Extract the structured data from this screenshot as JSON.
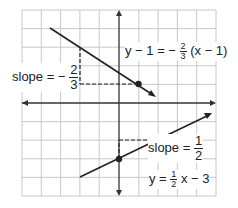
{
  "graph": {
    "grid": {
      "x_min": -5,
      "x_max": 5,
      "y_min": -5,
      "y_max": 5,
      "step": 1
    },
    "colors": {
      "grid": "#c8c8c8",
      "axis": "#333333",
      "line": "#222222",
      "dash": "#222222"
    },
    "lines": [
      {
        "equation_label": {
          "lhs": "y − 1 = −",
          "frac_num": "2",
          "frac_den": "3",
          "rhs": "(x − 1)"
        },
        "slope_label": {
          "prefix": "slope = −",
          "frac_num": "2",
          "frac_den": "3"
        },
        "point": [
          1,
          1
        ],
        "from": [
          -3.5,
          4
        ],
        "to": [
          2,
          0.33
        ],
        "slope": -0.6667
      },
      {
        "equation_label": {
          "lhs": "y =",
          "frac_num": "1",
          "frac_den": "2",
          "rhs": "x − 3"
        },
        "slope_label": {
          "prefix": "slope =",
          "frac_num": "1",
          "frac_den": "2"
        },
        "point": [
          0,
          -3
        ],
        "from": [
          -2,
          -4
        ],
        "to": [
          5,
          -0.5
        ],
        "slope": 0.5
      }
    ]
  }
}
